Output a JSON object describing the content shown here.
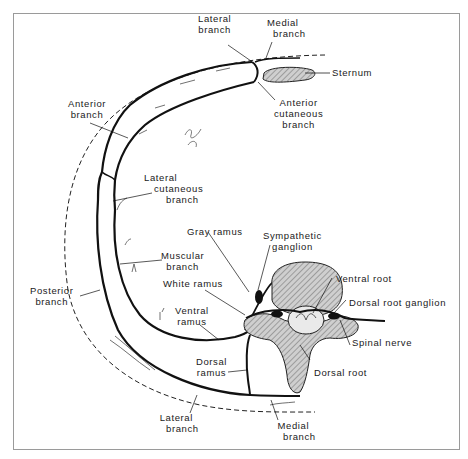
{
  "figure": {
    "colors": {
      "line": "#111111",
      "frame": "#9a9a9a",
      "bone_fill": "#bdbdbd",
      "background": "#ffffff"
    },
    "labels": {
      "lateral_branch_top": [
        "Lateral",
        "branch"
      ],
      "medial_branch_top": [
        "Medial",
        "branch"
      ],
      "sternum": "Sternum",
      "anterior_branch": [
        "Anterior",
        "branch"
      ],
      "anterior_cutaneous_branch": [
        "Anterior",
        "cutaneous",
        "branch"
      ],
      "lateral_cutaneous_branch": [
        "Lateral",
        "cutaneous",
        "branch"
      ],
      "gray_ramus": "Gray ramus",
      "sympathetic_ganglion": [
        "Sympathetic",
        "ganglion"
      ],
      "muscular_branch": [
        "Muscular",
        "branch"
      ],
      "posterior_branch": [
        "Posterior",
        "branch"
      ],
      "white_ramus": "White ramus",
      "ventral_root": "Ventral root",
      "dorsal_root_ganglion": "Dorsal root ganglion",
      "ventral_ramus": [
        "Ventral",
        "ramus"
      ],
      "spinal_nerve": "Spinal nerve",
      "dorsal_ramus": [
        "Dorsal",
        "ramus"
      ],
      "dorsal_root": "Dorsal root",
      "lateral_branch_bottom": [
        "Lateral",
        "branch"
      ],
      "medial_branch_bottom": [
        "Medial",
        "branch"
      ]
    }
  }
}
